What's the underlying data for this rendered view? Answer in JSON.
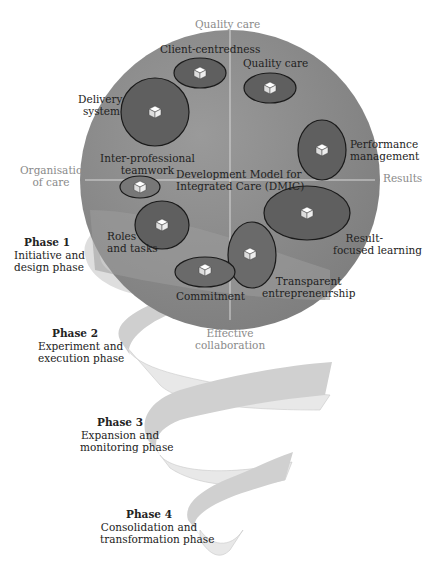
{
  "diagram": {
    "title": "Development Model for Integrated Care (DMIC)",
    "axes": {
      "top": "Quality care",
      "left_line1": "Organisation",
      "left_line2": "of care",
      "right": "Results",
      "bottom_line1": "Effective",
      "bottom_line2": "collaboration"
    },
    "center_label_line1": "Development Model for",
    "center_label_line2": "Integrated Care (DMIC)",
    "clusters": [
      {
        "name": "Client-centredness",
        "lines": [
          "Client-centredness"
        ]
      },
      {
        "name": "Quality care",
        "lines": [
          "Quality care"
        ]
      },
      {
        "name": "Delivery system",
        "lines": [
          "Delivery",
          "system"
        ]
      },
      {
        "name": "Performance management",
        "lines": [
          "Performance",
          "management"
        ]
      },
      {
        "name": "Inter-professional teamwork",
        "lines": [
          "Inter-professional",
          "teamwork"
        ]
      },
      {
        "name": "Result-focused learning",
        "lines": [
          "Result-",
          "focused learning"
        ]
      },
      {
        "name": "Roles and tasks",
        "lines": [
          "Roles",
          "and tasks"
        ]
      },
      {
        "name": "Transparent entrepreneurship",
        "lines": [
          "Transparent",
          "entrepreneurship"
        ]
      },
      {
        "name": "Commitment",
        "lines": [
          "Commitment"
        ]
      }
    ],
    "phases": [
      {
        "title": "Phase 1",
        "line1": "Initiative and",
        "line2": "design phase"
      },
      {
        "title": "Phase 2",
        "line1": "Experiment and",
        "line2": "execution phase"
      },
      {
        "title": "Phase 3",
        "line1": "Expansion and",
        "line2": "monitoring phase"
      },
      {
        "title": "Phase 4",
        "line1": "Consolidation and",
        "line2": "transformation phase"
      }
    ],
    "colors": {
      "sphere": "#8c8c8c",
      "cluster_fill": "#5f5f5f",
      "cluster_stroke": "#1a1a1a",
      "ribbon_light": "#e6e6e6",
      "ribbon_dark": "#cfcfcf",
      "axis_text": "#8a8a8a"
    }
  }
}
